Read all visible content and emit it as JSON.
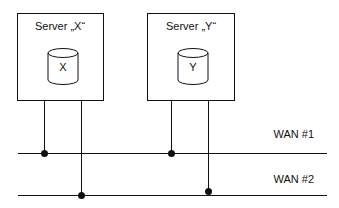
{
  "servers": [
    {
      "title": "Server „X“",
      "db_label": "X"
    },
    {
      "title": "Server „Y“",
      "db_label": "Y"
    }
  ],
  "networks": [
    {
      "label": "WAN #1"
    },
    {
      "label": "WAN #2"
    }
  ],
  "colors": {
    "stroke": "#111111",
    "background": "#ffffff"
  }
}
